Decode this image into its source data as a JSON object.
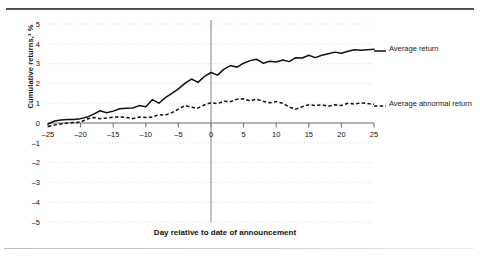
{
  "chart_data": {
    "type": "line",
    "title": "",
    "xlabel": "Day relative to date of announcement",
    "ylabel": "Cumulative returns,¹ %",
    "xlim": [
      -25,
      25
    ],
    "ylim": [
      -5,
      5
    ],
    "xticks": [
      -25,
      -20,
      -15,
      -10,
      -5,
      0,
      5,
      10,
      15,
      20,
      25
    ],
    "yticks": [
      5,
      4,
      3,
      2,
      1,
      0,
      -1,
      -2,
      -3,
      -4,
      -5
    ],
    "xticklabels": [
      "–25",
      "–20",
      "–15",
      "–10",
      "–5",
      "0",
      "5",
      "10",
      "15",
      "20",
      "25"
    ],
    "yticklabels": [
      "5",
      "4",
      "3",
      "2",
      "1",
      "0",
      "–1",
      "–2",
      "–3",
      "–4",
      "–5"
    ],
    "grid": true,
    "grid_axis": "y",
    "legend_position": "right",
    "annotations": [
      {
        "name": "event-day-line",
        "type": "vline",
        "x": 0,
        "label": "0"
      }
    ],
    "x": [
      -25,
      -24,
      -23,
      -22,
      -21,
      -20,
      -19,
      -18,
      -17,
      -16,
      -15,
      -14,
      -13,
      -12,
      -11,
      -10,
      -9,
      -8,
      -7,
      -6,
      -5,
      -4,
      -3,
      -2,
      -1,
      0,
      1,
      2,
      3,
      4,
      5,
      6,
      7,
      8,
      9,
      10,
      11,
      12,
      13,
      14,
      15,
      16,
      17,
      18,
      19,
      20,
      21,
      22,
      23,
      24,
      25
    ],
    "series": [
      {
        "name": "Average return",
        "style": "solid",
        "values": [
          -0.05,
          0.1,
          0.15,
          0.18,
          0.18,
          0.22,
          0.3,
          0.45,
          0.62,
          0.52,
          0.6,
          0.72,
          0.75,
          0.76,
          0.88,
          0.82,
          1.18,
          1.0,
          1.28,
          1.5,
          1.72,
          2.0,
          2.22,
          2.05,
          2.35,
          2.55,
          2.42,
          2.72,
          2.9,
          2.82,
          3.02,
          3.15,
          3.22,
          3.02,
          3.12,
          3.08,
          3.18,
          3.1,
          3.3,
          3.28,
          3.42,
          3.3,
          3.42,
          3.5,
          3.58,
          3.52,
          3.62,
          3.7,
          3.68,
          3.7,
          3.72
        ]
      },
      {
        "name": "Average abnormal return",
        "style": "dashed",
        "values": [
          -0.18,
          -0.1,
          -0.05,
          0.0,
          0.02,
          0.05,
          0.2,
          0.28,
          0.22,
          0.25,
          0.3,
          0.3,
          0.28,
          0.22,
          0.3,
          0.28,
          0.3,
          0.42,
          0.4,
          0.52,
          0.7,
          0.88,
          0.8,
          0.75,
          0.92,
          1.02,
          0.98,
          1.1,
          1.08,
          1.2,
          1.22,
          1.12,
          1.2,
          1.1,
          1.02,
          1.08,
          1.0,
          0.8,
          0.7,
          0.82,
          0.92,
          0.88,
          0.92,
          0.85,
          0.92,
          0.88,
          1.0,
          0.95,
          1.02,
          0.98,
          0.95
        ]
      }
    ]
  },
  "legend": {
    "average_return": "Average return",
    "average_abnormal_return": "Average abnormal return"
  },
  "axis_titles": {
    "x": "Day relative to date of announcement",
    "y": "Cumulative returns,¹ %"
  },
  "colors": {
    "series": "#111111",
    "gridline": "#c9c9c9",
    "axis": "#6f6f6f",
    "event_line": "#8a8a8a",
    "rule_top": "#3b3b3b",
    "rule_bottom": "#cfcfcf",
    "background": "#ffffff"
  }
}
